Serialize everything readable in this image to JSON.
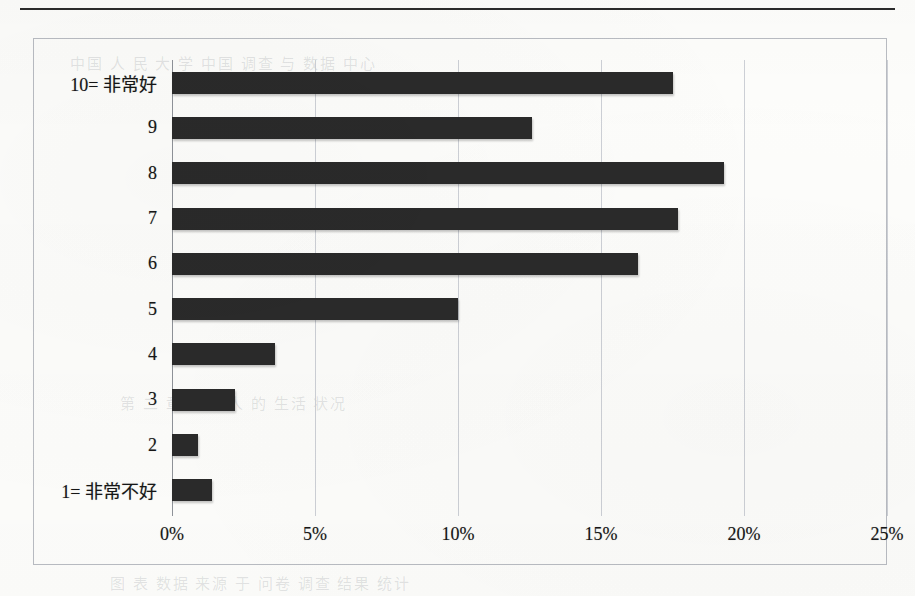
{
  "page": {
    "bleed_text_top": "中国 人 民 大 学 中国 调查 与 数据 中心",
    "bleed_text_mid": "第 二 章  中国 人 的 生活 状况",
    "bleed_text_bottom": "图 表  数据 来源 于 问卷 调查 结果 统计"
  },
  "chart_data": {
    "type": "bar",
    "orientation": "horizontal",
    "title": "",
    "xlabel": "",
    "ylabel": "",
    "categories": [
      "10= 非常好",
      "9",
      "8",
      "7",
      "6",
      "5",
      "4",
      "3",
      "2",
      "1= 非常不好"
    ],
    "values": [
      17.5,
      12.6,
      19.3,
      17.7,
      16.3,
      10.0,
      3.6,
      2.2,
      0.9,
      1.4
    ],
    "value_unit": "%",
    "xlim": [
      0,
      25
    ],
    "xticks": [
      0,
      5,
      10,
      15,
      20,
      25
    ],
    "xtick_labels": [
      "0%",
      "5%",
      "10%",
      "15%",
      "20%",
      "25%"
    ],
    "grid": "vertical",
    "legend": "none",
    "bar_color": "#2a2a2a",
    "frame_color": "#b9bcc2",
    "gridline_color": "#cdd0d6"
  }
}
